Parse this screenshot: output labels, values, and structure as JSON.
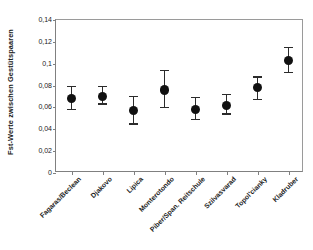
{
  "chart_data": {
    "type": "scatter",
    "title": "",
    "xlabel": "",
    "ylabel": "Fst-Werte zwischen Gestütspaaren",
    "ylim": [
      0,
      0.14
    ],
    "grid": false,
    "legend": "none",
    "decimal_separator": ",",
    "ytick_labels": [
      "0",
      "0,02",
      "0,04",
      "0,06",
      "0,08",
      "0,1",
      "0,12",
      "0,14"
    ],
    "ytick_values": [
      0,
      0.02,
      0.04,
      0.06,
      0.08,
      0.1,
      0.12,
      0.14
    ],
    "categories": [
      "Fagaras/Beclean",
      "Djakovo",
      "Lipica",
      "Monterotondo",
      "Piber/Span. Reitschule",
      "Szilvasvarad",
      "Topol'cianky",
      "Kladruber"
    ],
    "values": [
      0.068,
      0.07,
      0.057,
      0.076,
      0.058,
      0.062,
      0.078,
      0.103
    ],
    "error_low": [
      0.058,
      0.063,
      0.045,
      0.06,
      0.049,
      0.054,
      0.067,
      0.092
    ],
    "error_high": [
      0.079,
      0.079,
      0.07,
      0.094,
      0.069,
      0.072,
      0.088,
      0.115
    ],
    "marker": "filled-circle",
    "marker_color": "#111111",
    "errorbar_color": "#2b2b2b",
    "axis_color": "#808080",
    "background_color": "#ffffff"
  }
}
